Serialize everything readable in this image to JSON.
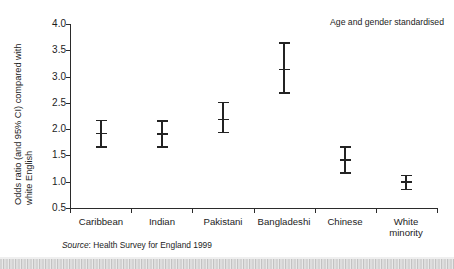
{
  "chart_data": {
    "type": "scatter",
    "title": "",
    "subtitle": "",
    "annotation": "Age and gender standardised",
    "xlabel": "",
    "ylabel_line1": "Odds ratio (and 95% CI) compared with",
    "ylabel_line2": "white English",
    "categories": [
      "Caribbean",
      "Indian",
      "Pakistani",
      "Bangladeshi",
      "Chinese",
      "White minority"
    ],
    "category_lines": [
      [
        "Caribbean"
      ],
      [
        "Indian"
      ],
      [
        "Pakistani"
      ],
      [
        "Bangladeshi"
      ],
      [
        "Chinese"
      ],
      [
        "White",
        "minority"
      ]
    ],
    "values": [
      1.93,
      1.92,
      2.2,
      3.15,
      1.43,
      1.01
    ],
    "ci_lower": [
      1.68,
      1.68,
      1.95,
      2.7,
      1.18,
      0.87
    ],
    "ci_upper": [
      2.18,
      2.17,
      2.52,
      3.65,
      1.68,
      1.13
    ],
    "ylim": [
      0.5,
      4.0
    ],
    "yticks": [
      4.0,
      3.5,
      3.0,
      2.5,
      2.0,
      1.5,
      1.0,
      0.5
    ],
    "ytick_labels": [
      "4.0",
      "3.5",
      "3.0",
      "2.5",
      "2.0",
      "1.5",
      "1.0",
      "0.5"
    ],
    "grid": false,
    "legend": false,
    "series": [
      {
        "name": "Odds ratio",
        "values": [
          1.93,
          1.92,
          2.2,
          3.15,
          1.43,
          1.01
        ],
        "ci_lower": [
          1.68,
          1.68,
          1.95,
          2.7,
          1.18,
          0.87
        ],
        "ci_upper": [
          2.18,
          2.17,
          2.52,
          3.65,
          1.68,
          1.13
        ]
      }
    ],
    "marker_color": "#232323",
    "axis_color": "#2b2b2b"
  },
  "source": {
    "label": "Source",
    "separator": ": ",
    "text": "Health Survey for England 1999"
  }
}
